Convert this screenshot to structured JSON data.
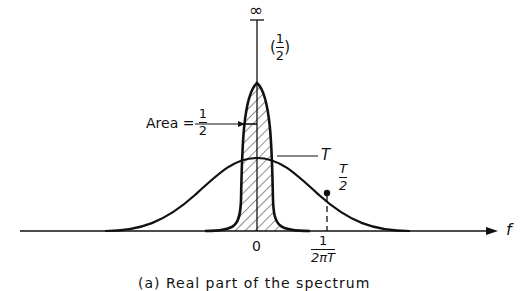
{
  "figure": {
    "caption": "(a)  Real part of the spectrum",
    "axis": {
      "x_label": "f",
      "origin_label": "0",
      "marker_label": {
        "numerator": "1",
        "denominator": "2πT"
      },
      "vertical_top_label": "∞"
    },
    "narrow_peak": {
      "annotation": {
        "open": "(",
        "numerator": "1",
        "denominator": "2",
        "close": ")"
      },
      "area_label": {
        "prefix": "Area = ",
        "numerator": "1",
        "denominator": "2"
      }
    },
    "broad_curve": {
      "peak_label": "T",
      "half_label": {
        "numerator": "T",
        "denominator": "2"
      }
    },
    "colors": {
      "ink": "#111111",
      "background": "#ffffff"
    }
  }
}
